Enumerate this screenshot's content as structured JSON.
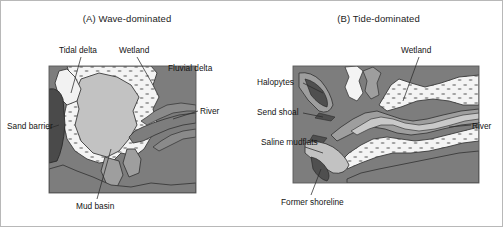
{
  "figure": {
    "kind": "estuary-comparison-diagram",
    "panels": [
      {
        "id": "A",
        "title": "(A) Wave-dominated",
        "labels": [
          {
            "name": "tidal-delta",
            "text": "Tidal delta"
          },
          {
            "name": "wetland",
            "text": "Wetland"
          },
          {
            "name": "fluvial-delta",
            "text": "Fluvial delta"
          },
          {
            "name": "river",
            "text": "River"
          },
          {
            "name": "sand-barrier",
            "text": "Sand barrier"
          },
          {
            "name": "mud-basin",
            "text": "Mud basin"
          }
        ]
      },
      {
        "id": "B",
        "title": "(B) Tide-dominated",
        "labels": [
          {
            "name": "wetland",
            "text": "Wetland"
          },
          {
            "name": "halopytes",
            "text": "Halopytes"
          },
          {
            "name": "send-shoal",
            "text": "Send shoal"
          },
          {
            "name": "saline-mudflats",
            "text": "Saline mudflats"
          },
          {
            "name": "river",
            "text": "River"
          },
          {
            "name": "former-shoreline",
            "text": "Former shoreline"
          }
        ]
      }
    ],
    "colors": {
      "land_dark": "#7d7d7d",
      "barrier_darkest": "#4a4a4a",
      "mid_gray": "#9e9e9e",
      "light_gray": "#c2c2c2",
      "sand_white": "#f4f4f4",
      "outline": "#3a3a3a",
      "text": "#141414",
      "frame": "#b8b8b8",
      "background": "#ffffff"
    }
  }
}
